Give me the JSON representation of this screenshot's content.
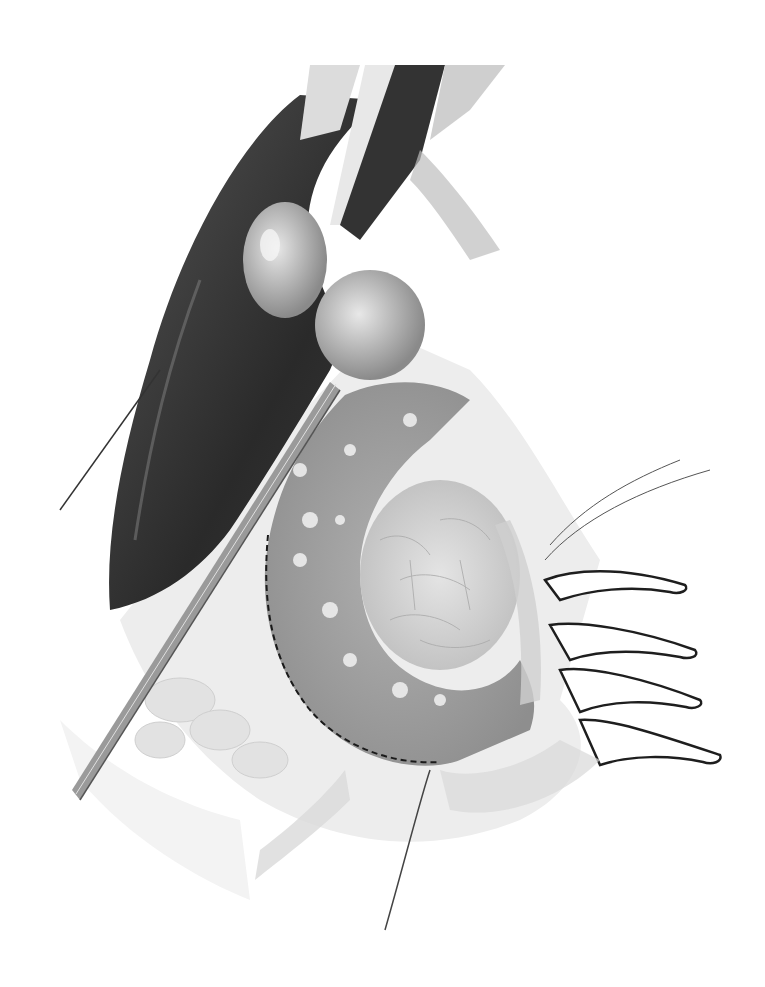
{
  "image": {
    "kind": "grayscale surgical illustration",
    "subject": "open abdominal view: liver, gallbladder, duodenal C-loop with dashed incision line, pancreatic head, retracting hand and surgical instrument",
    "background": "#ffffff",
    "palette": {
      "dark": "#2e2e2e",
      "mid": "#8c8c8c",
      "light": "#c8c8c8",
      "pale": "#e6e6e6",
      "line": "#1a1a1a"
    }
  }
}
